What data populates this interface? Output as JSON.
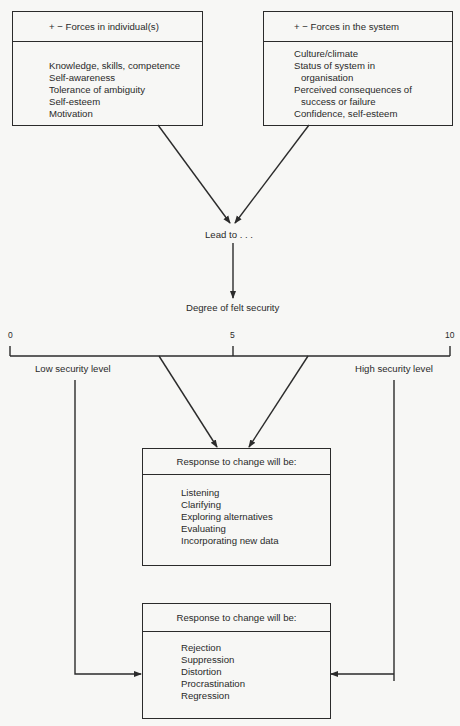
{
  "diagram": {
    "colors": {
      "line": "#2b2b2b",
      "background": "#f7f7f5",
      "text": "#2a2a2a"
    },
    "box_individual": {
      "title": "+ − Forces in individual(s)",
      "items": [
        "Knowledge, skills, competence",
        "Self-awareness",
        "Tolerance of ambiguity",
        "Self-esteem",
        "Motivation"
      ]
    },
    "box_system": {
      "title": "+ − Forces in the system",
      "items": [
        {
          "text": "Culture/climate",
          "indent": false
        },
        {
          "text": "Status of system in",
          "indent": false
        },
        {
          "text": "organisation",
          "indent": true
        },
        {
          "text": "Perceived consequences of",
          "indent": false
        },
        {
          "text": "success or failure",
          "indent": true
        },
        {
          "text": "Confidence, self-esteem",
          "indent": false
        }
      ]
    },
    "lead_to": "Lead to . . .",
    "felt_security": "Degree of felt security",
    "scale": {
      "tick_min": "0",
      "tick_mid": "5",
      "tick_max": "10",
      "low_label": "Low security level",
      "high_label": "High security level"
    },
    "box_response_positive": {
      "title": "Response to change will be:",
      "items": [
        "Listening",
        "Clarifying",
        "Exploring alternatives",
        "Evaluating",
        "Incorporating new data"
      ]
    },
    "box_response_negative": {
      "title": "Response to change will be:",
      "items": [
        "Rejection",
        "Suppression",
        "Distortion",
        "Procrastination",
        "Regression"
      ]
    }
  }
}
